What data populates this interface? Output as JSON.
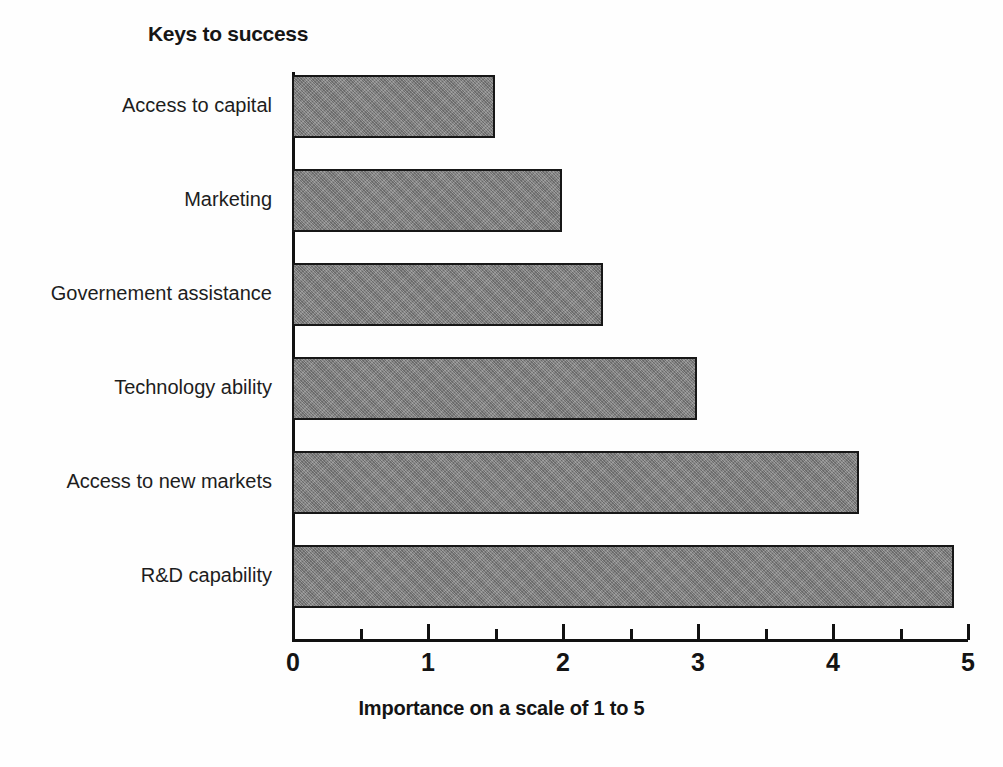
{
  "chart_data": {
    "type": "bar",
    "orientation": "horizontal",
    "title": "Keys to success",
    "xlabel": "Importance on a scale of 1 to 5",
    "ylabel": "",
    "categories": [
      "Access to capital",
      "Marketing",
      "Governement assistance",
      "Technology ability",
      "Access to new markets",
      "R&D capability"
    ],
    "values": [
      1.5,
      2.0,
      2.3,
      3.0,
      4.2,
      4.9
    ],
    "xlim": [
      0,
      5
    ],
    "xticks": [
      0,
      1,
      2,
      3,
      4,
      5
    ],
    "xtick_labels": [
      "0",
      "1",
      "2",
      "3",
      "4",
      "5"
    ],
    "minor_xticks": [
      0.5,
      1.5,
      2.5,
      3.5,
      4.5
    ],
    "grid": false,
    "legend": false,
    "bar_fill_color": "#808080",
    "bar_edge_color": "#171717",
    "axis_color": "#111111",
    "background_color": "#fefefe"
  }
}
